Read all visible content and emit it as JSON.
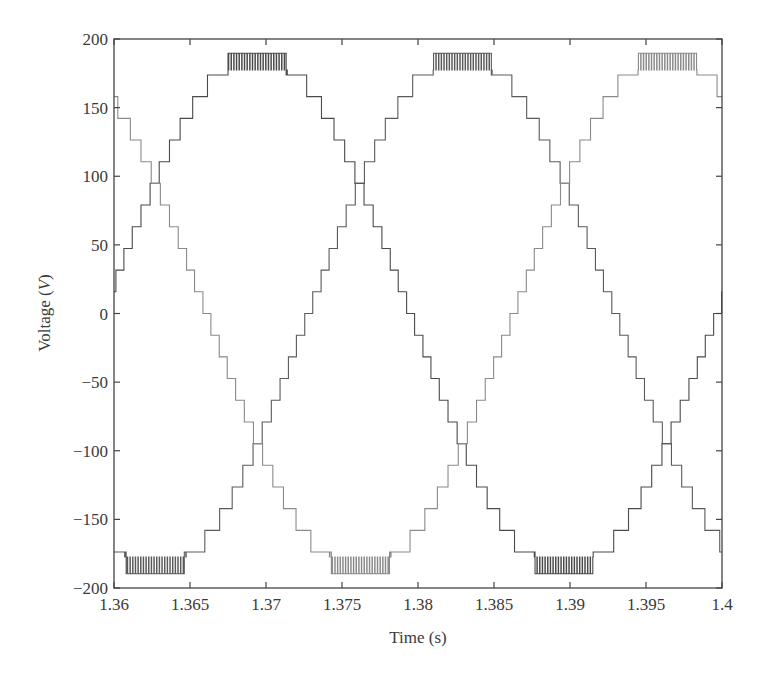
{
  "chart_data": {
    "type": "line",
    "title": "",
    "xlabel": "Time (s)",
    "ylabel_prefix": "Voltage (",
    "ylabel_unit": "V",
    "ylabel_suffix": ")",
    "xlim": [
      1.36,
      1.4
    ],
    "ylim": [
      -200,
      200
    ],
    "xticks": [
      1.36,
      1.365,
      1.37,
      1.375,
      1.38,
      1.385,
      1.39,
      1.395,
      1.4
    ],
    "xtick_labels": [
      "1.36",
      "1.365",
      "1.37",
      "1.375",
      "1.38",
      "1.385",
      "1.39",
      "1.395",
      "1.4"
    ],
    "yticks": [
      200,
      150,
      100,
      50,
      0,
      -50,
      -100,
      -150,
      -200
    ],
    "ytick_labels": [
      "200",
      "150",
      "100",
      "50",
      "0",
      "−50",
      "−100",
      "−150",
      "−200"
    ],
    "grid": false,
    "legend": null,
    "waveform": "multilevel staircase sinusoid (three-phase)",
    "amplitude": 190,
    "period": 0.0404,
    "step_size": 15.8,
    "series": [
      {
        "name": "phase-a",
        "peak_time": 1.3694,
        "color": "#4a4a4a"
      },
      {
        "name": "phase-b",
        "peak_time": 1.3829,
        "color": "#5a5a5a"
      },
      {
        "name": "phase-c",
        "peak_time": 1.3964,
        "color": "#8a8a8a"
      }
    ],
    "sample_points": {
      "x": [
        1.36,
        1.3627,
        1.3694,
        1.376,
        1.383,
        1.3896,
        1.3964,
        1.4
      ],
      "phase-a": [
        25,
        95,
        190,
        98,
        -95,
        -190,
        -85,
        5
      ],
      "phase-b": [
        150,
        95,
        -95,
        -190,
        190,
        98,
        -95,
        -175
      ],
      "phase-c": [
        -180,
        -190,
        -95,
        95,
        -95,
        95,
        190,
        160
      ]
    }
  }
}
